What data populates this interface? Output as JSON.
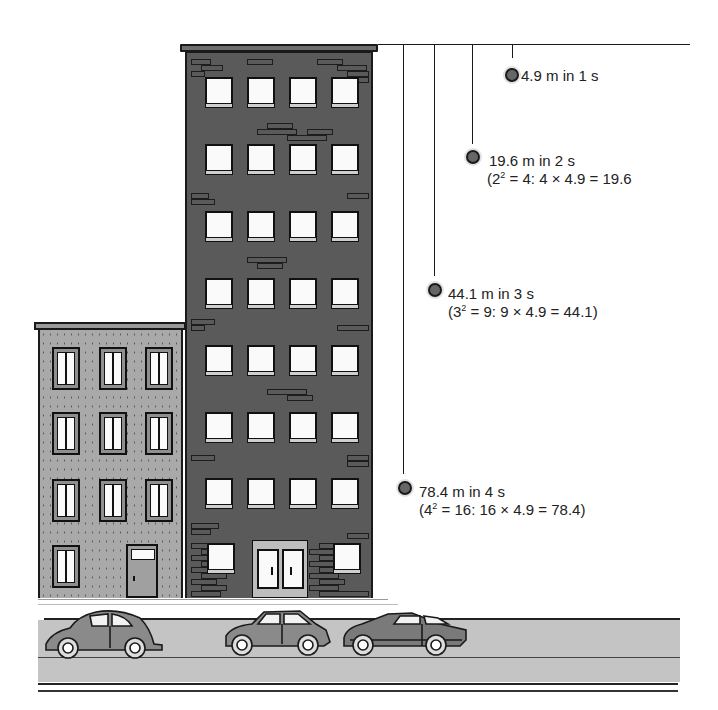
{
  "figure": {
    "gravity_per_second_distance_m": 4.9
  },
  "drops": [
    {
      "time_s": 1,
      "distance_m": 4.9,
      "label": "4.9 m in 1 s",
      "detail": ""
    },
    {
      "time_s": 2,
      "distance_m": 19.6,
      "label": "19.6 m in 2 s",
      "detail_prefix": "(2",
      "detail_exp": "2",
      "detail_suffix": " = 4: 4 × 4.9 = 19.6"
    },
    {
      "time_s": 3,
      "distance_m": 44.1,
      "label": "44.1 m in 3 s",
      "detail_prefix": "(3",
      "detail_exp": "2",
      "detail_suffix": " = 9: 9 × 4.9 = 44.1)"
    },
    {
      "time_s": 4,
      "distance_m": 78.4,
      "label": "78.4 m in 4 s",
      "detail_prefix": "(4",
      "detail_exp": "2",
      "detail_suffix": " = 16: 16 × 4.9 = 78.4)"
    }
  ],
  "colors": {
    "brick_building": "#5a5a5a",
    "stucco_building": "#a9a9a9",
    "ball": "#666666",
    "road": "#c4c4c4",
    "line": "#1a1a1a"
  },
  "scene": {
    "tall_building": {
      "floors": 8,
      "windows_per_floor": 4
    },
    "short_building": {
      "floors": 4,
      "windows_per_floor": 3
    },
    "cars": [
      "beetle",
      "hatchback",
      "coupe"
    ]
  }
}
